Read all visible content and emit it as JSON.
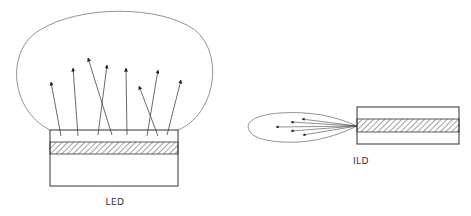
{
  "diagram": {
    "led": {
      "label": "LED",
      "arrow_count": 8
    },
    "ild": {
      "label": "ILD",
      "arrow_count": 5
    },
    "colors": {
      "stroke": "#333333",
      "lobe": "#777777",
      "background": "#ffffff"
    }
  }
}
